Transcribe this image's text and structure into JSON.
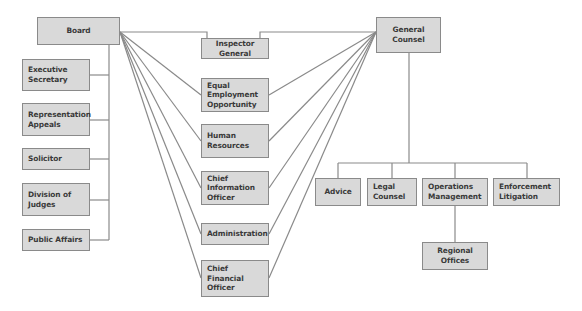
{
  "diagram": {
    "type": "org-chart",
    "colors": {
      "box_fill": "#d9d9d9",
      "box_border": "#8a8a8a",
      "line": "#8a8a8a",
      "text": "#3a3a3a"
    },
    "nodes": {
      "board": {
        "label": "Board"
      },
      "general_counsel": {
        "label": "General\nCounsel"
      },
      "executive_secretary": {
        "label": "Executive\nSecretary"
      },
      "representation_appeals": {
        "label": "Representation\nAppeals"
      },
      "solicitor": {
        "label": "Solicitor"
      },
      "division_of_judges": {
        "label": "Division of\nJudges"
      },
      "public_affairs": {
        "label": "Public Affairs"
      },
      "inspector_general": {
        "label": "Inspector\nGeneral"
      },
      "equal_employment_opportunity": {
        "label": "Equal\nEmployment\nOpportunity"
      },
      "human_resources": {
        "label": "Human\nResources"
      },
      "chief_information_officer": {
        "label": "Chief\nInformation\nOfficer"
      },
      "administration": {
        "label": "Administration"
      },
      "chief_financial_officer": {
        "label": "Chief\nFinancial\nOfficer"
      },
      "advice": {
        "label": "Advice"
      },
      "legal_counsel": {
        "label": "Legal\nCounsel"
      },
      "operations_management": {
        "label": "Operations\nManagement"
      },
      "enforcement_litigation": {
        "label": "Enforcement\nLitigation"
      },
      "regional_offices": {
        "label": "Regional Offices"
      }
    },
    "edges": [
      [
        "Board",
        "Executive Secretary"
      ],
      [
        "Board",
        "Representation Appeals"
      ],
      [
        "Board",
        "Solicitor"
      ],
      [
        "Board",
        "Division of Judges"
      ],
      [
        "Board",
        "Public Affairs"
      ],
      [
        "Board",
        "Inspector General"
      ],
      [
        "General Counsel",
        "Inspector General"
      ],
      [
        "Board",
        "Equal Employment Opportunity"
      ],
      [
        "General Counsel",
        "Equal Employment Opportunity"
      ],
      [
        "Board",
        "Human Resources"
      ],
      [
        "General Counsel",
        "Human Resources"
      ],
      [
        "Board",
        "Chief Information Officer"
      ],
      [
        "General Counsel",
        "Chief Information Officer"
      ],
      [
        "Board",
        "Administration"
      ],
      [
        "General Counsel",
        "Administration"
      ],
      [
        "Board",
        "Chief Financial Officer"
      ],
      [
        "General Counsel",
        "Chief Financial Officer"
      ],
      [
        "General Counsel",
        "Advice"
      ],
      [
        "General Counsel",
        "Legal Counsel"
      ],
      [
        "General Counsel",
        "Operations Management"
      ],
      [
        "General Counsel",
        "Enforcement Litigation"
      ],
      [
        "Operations Management",
        "Regional Offices"
      ]
    ]
  }
}
